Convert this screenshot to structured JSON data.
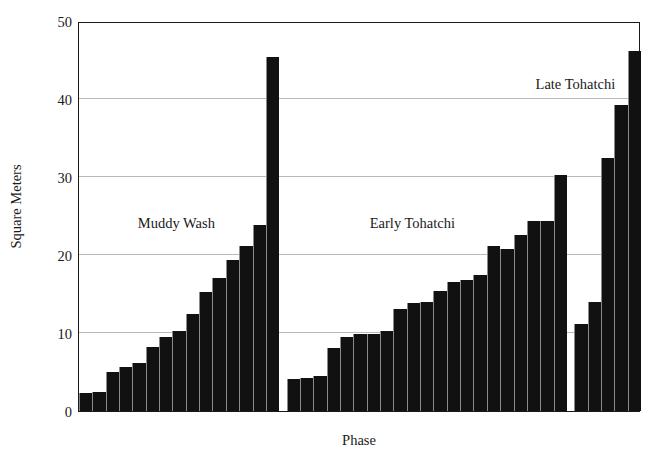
{
  "chart_data": {
    "type": "bar",
    "title": "",
    "xlabel": "Phase",
    "ylabel": "Square Meters",
    "ylim": [
      0,
      50
    ],
    "yticks": [
      0,
      10,
      20,
      30,
      40,
      50
    ],
    "grid": true,
    "legend_position": "none",
    "bar_color": "#111111",
    "background_color": "#ffffff",
    "axis_color": "#1a1a1a",
    "gridline_color": "#b9b9b9",
    "annotations": [
      {
        "text": "Muddy Wash",
        "x_frac": 0.175,
        "y_value": 24.2
      },
      {
        "text": "Early Tohatchi",
        "x_frac": 0.595,
        "y_value": 24.2
      },
      {
        "text": "Late Tohatchi",
        "x_frac": 0.885,
        "y_value": 42.0
      }
    ],
    "groups": [
      {
        "name": "Muddy Wash",
        "values": [
          2.3,
          2.5,
          5.0,
          5.7,
          6.2,
          8.2,
          9.5,
          10.3,
          12.5,
          15.3,
          17.0,
          19.4,
          21.2,
          23.9,
          45.4
        ]
      },
      {
        "name": "Early Tohatchi",
        "values": [
          4.1,
          4.2,
          4.5,
          8.1,
          9.5,
          9.9,
          9.9,
          10.2,
          13.1,
          13.8,
          14.0,
          15.4,
          16.6,
          16.8,
          17.4,
          21.2,
          20.8,
          22.6,
          24.3,
          24.4,
          30.3
        ]
      },
      {
        "name": "Late Tohatchi",
        "values": [
          11.1,
          14.0,
          32.5,
          39.2,
          46.2
        ]
      }
    ],
    "group_gap_bars": 0.55,
    "all_values_ordered": [
      2.3,
      2.5,
      5.0,
      5.7,
      6.2,
      8.2,
      9.5,
      10.3,
      12.5,
      15.3,
      17.0,
      19.4,
      21.2,
      23.9,
      45.4,
      4.1,
      4.2,
      4.5,
      8.1,
      9.5,
      9.9,
      9.9,
      10.2,
      13.1,
      13.8,
      14.0,
      15.4,
      16.6,
      16.8,
      17.4,
      21.2,
      20.8,
      22.6,
      24.3,
      24.4,
      30.3,
      11.1,
      14.0,
      32.5,
      39.2,
      46.2
    ]
  },
  "axes": {
    "ylabel": "Square Meters",
    "xlabel": "Phase",
    "ytick_labels": [
      "0",
      "10",
      "20",
      "30",
      "40",
      "50"
    ]
  }
}
